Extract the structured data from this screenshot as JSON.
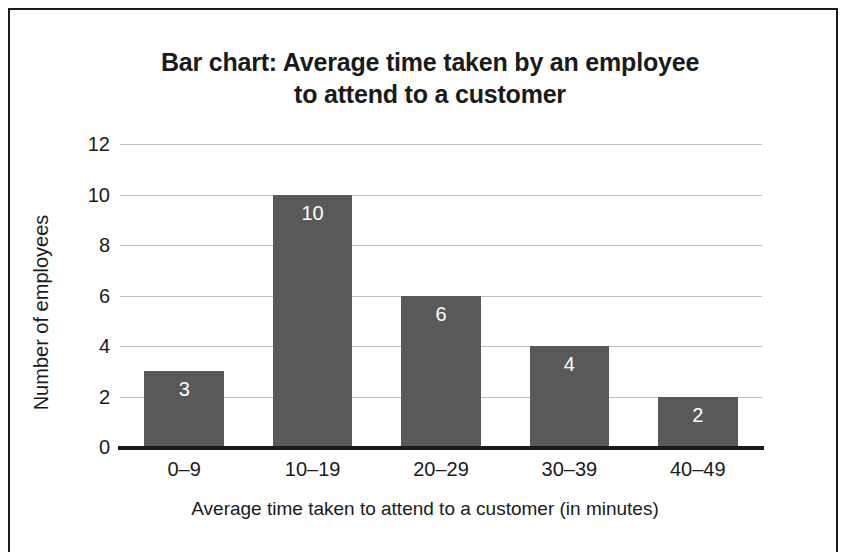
{
  "figure": {
    "border_color": "#1c1c1c",
    "background": "#ffffff"
  },
  "chart_data": {
    "type": "bar",
    "title": "Bar chart: Average time taken by an employee to attend to a customer",
    "title_lines": [
      "Bar chart: Average time taken by an employee",
      "to attend to a customer"
    ],
    "xlabel": "Average time taken to attend to a customer (in minutes)",
    "ylabel": "Number of employees",
    "categories": [
      "0–9",
      "10–19",
      "20–29",
      "30–39",
      "40–49"
    ],
    "values": [
      3,
      10,
      6,
      4,
      2
    ],
    "data_labels": [
      "3",
      "10",
      "6",
      "4",
      "2"
    ],
    "ylim": [
      0,
      12
    ],
    "yticks": [
      0,
      2,
      4,
      6,
      8,
      10,
      12
    ],
    "ytick_labels": [
      "0",
      "2",
      "4",
      "6",
      "8",
      "10",
      "12"
    ],
    "grid": "horizontal",
    "legend": "none",
    "bar_color": "#595959",
    "data_label_color": "#ffffff",
    "gridline_color": "#bdbdbd",
    "axis_color": "#1a1a1a"
  }
}
